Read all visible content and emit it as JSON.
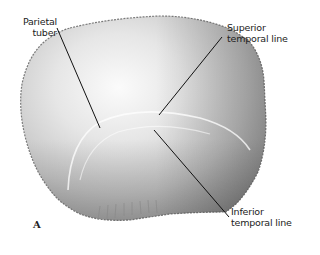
{
  "figure": {
    "panel_letter": "A",
    "labels": [
      {
        "id": "parietal-tuber",
        "lines": [
          "Parietal",
          "tuber"
        ]
      },
      {
        "id": "superior-temporal-line",
        "lines": [
          "Superior",
          "temporal line"
        ]
      },
      {
        "id": "inferior-temporal-line",
        "lines": [
          "Inferior",
          "temporal line"
        ]
      }
    ]
  },
  "colors": {
    "background": "#ffffff",
    "bone_light": "#f2f2f2",
    "bone_mid": "#cfcfcf",
    "bone_dark": "#9a9a9a",
    "leader_line": "#111111",
    "text": "#222222"
  }
}
